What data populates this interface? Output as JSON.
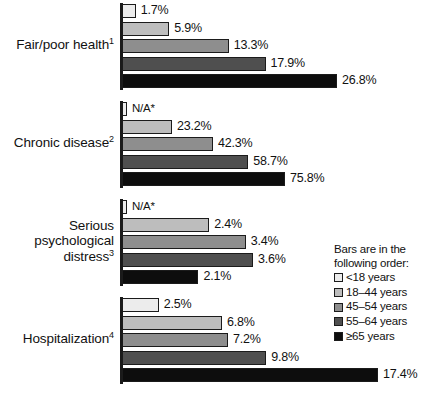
{
  "chart_data": {
    "type": "bar",
    "title": "",
    "xlabel": "",
    "ylabel": "",
    "orientation": "horizontal",
    "grid": false,
    "note": "Each category group is drawn on its own horizontal scale; bars within a group are proportional to each other.",
    "legend": {
      "position": "right",
      "title_line1": "Bars are in the",
      "title_line2": "following order:",
      "entries": [
        {
          "label": "<18 years",
          "color": "#ececec"
        },
        {
          "label": "18–44 years",
          "color": "#bdbdbd"
        },
        {
          "label": "45–54 years",
          "color": "#8e8e8e"
        },
        {
          "label": "55–64 years",
          "color": "#4f4f4f"
        },
        {
          "label": "≥65 years",
          "color": "#0d0d0d"
        }
      ]
    },
    "categories": [
      "Fair/poor health1",
      "Chronic disease2",
      "Serious psychological distress3",
      "Hospitalization4"
    ],
    "series": [
      {
        "name": "<18 years",
        "values": [
          1.7,
          null,
          null,
          2.5
        ]
      },
      {
        "name": "18–44 years",
        "values": [
          5.9,
          23.2,
          2.4,
          6.8
        ]
      },
      {
        "name": "45–54 years",
        "values": [
          13.3,
          42.3,
          3.4,
          7.2
        ]
      },
      {
        "name": "55–64 years",
        "values": [
          17.9,
          58.7,
          3.6,
          9.8
        ]
      },
      {
        "name": "≥65 years",
        "values": [
          26.8,
          75.8,
          2.1,
          17.4
        ]
      }
    ],
    "groups": [
      {
        "label_lines": [
          "Fair/poor health"
        ],
        "footnote": "1",
        "group_max": 26.8,
        "bars": [
          {
            "series": "<18 years",
            "value": 1.7,
            "value_label": "1.7%",
            "fill": "#ececec",
            "na": false
          },
          {
            "series": "18–44 years",
            "value": 5.9,
            "value_label": "5.9%",
            "fill": "#bdbdbd",
            "na": false
          },
          {
            "series": "45–54 years",
            "value": 13.3,
            "value_label": "13.3%",
            "fill": "#8e8e8e",
            "na": false
          },
          {
            "series": "55–64 years",
            "value": 17.9,
            "value_label": "17.9%",
            "fill": "#4f4f4f",
            "na": false
          },
          {
            "series": "≥65 years",
            "value": 26.8,
            "value_label": "26.8%",
            "fill": "#0d0d0d",
            "na": false
          }
        ]
      },
      {
        "label_lines": [
          "Chronic disease"
        ],
        "footnote": "2",
        "group_max": 75.8,
        "bars": [
          {
            "series": "<18 years",
            "value": null,
            "value_label": "N/A*",
            "fill": "#ececec",
            "na": true
          },
          {
            "series": "18–44 years",
            "value": 23.2,
            "value_label": "23.2%",
            "fill": "#bdbdbd",
            "na": false
          },
          {
            "series": "45–54 years",
            "value": 42.3,
            "value_label": "42.3%",
            "fill": "#8e8e8e",
            "na": false
          },
          {
            "series": "55–64 years",
            "value": 58.7,
            "value_label": "58.7%",
            "fill": "#4f4f4f",
            "na": false
          },
          {
            "series": "≥65 years",
            "value": 75.8,
            "value_label": "75.8%",
            "fill": "#0d0d0d",
            "na": false
          }
        ]
      },
      {
        "label_lines": [
          "Serious",
          "psychological",
          "distress"
        ],
        "footnote": "3",
        "group_max": 3.6,
        "bars": [
          {
            "series": "<18 years",
            "value": null,
            "value_label": "N/A*",
            "fill": "#ececec",
            "na": true
          },
          {
            "series": "18–44 years",
            "value": 2.4,
            "value_label": "2.4%",
            "fill": "#bdbdbd",
            "na": false
          },
          {
            "series": "45–54 years",
            "value": 3.4,
            "value_label": "3.4%",
            "fill": "#8e8e8e",
            "na": false
          },
          {
            "series": "55–64 years",
            "value": 3.6,
            "value_label": "3.6%",
            "fill": "#4f4f4f",
            "na": false
          },
          {
            "series": "≥65 years",
            "value": 2.1,
            "value_label": "2.1%",
            "fill": "#0d0d0d",
            "na": false
          }
        ]
      },
      {
        "label_lines": [
          "Hospitalization"
        ],
        "footnote": "4",
        "group_max": 17.4,
        "bars": [
          {
            "series": "<18 years",
            "value": 2.5,
            "value_label": "2.5%",
            "fill": "#ececec",
            "na": false
          },
          {
            "series": "18–44 years",
            "value": 6.8,
            "value_label": "6.8%",
            "fill": "#bdbdbd",
            "na": false
          },
          {
            "series": "45–54 years",
            "value": 7.2,
            "value_label": "7.2%",
            "fill": "#8e8e8e",
            "na": false
          },
          {
            "series": "55–64 years",
            "value": 9.8,
            "value_label": "9.8%",
            "fill": "#4f4f4f",
            "na": false
          },
          {
            "series": "≥65 years",
            "value": 17.4,
            "value_label": "17.4%",
            "fill": "#0d0d0d",
            "na": false
          }
        ]
      }
    ]
  },
  "layout": {
    "group_tops": [
      4,
      102,
      200,
      298
    ],
    "group_max_px": [
      215,
      163,
      131,
      256
    ],
    "na_bar_px": 5,
    "bar_height": 14,
    "bar_gap": 3.5,
    "label_mid_offsets": [
      33,
      33,
      25,
      33
    ]
  }
}
